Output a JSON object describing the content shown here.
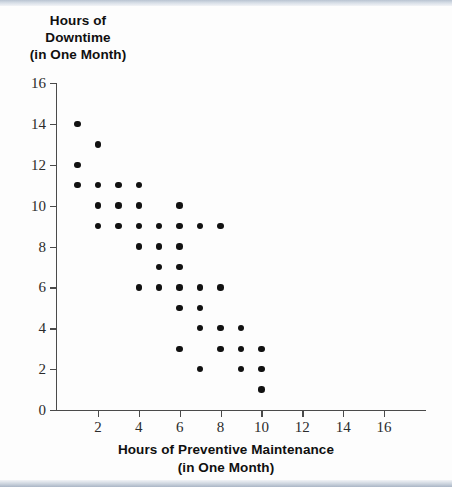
{
  "chart_data": {
    "type": "scatter",
    "title": "",
    "ylabel_lines": [
      "Hours of",
      "Downtime",
      "(in One Month)"
    ],
    "xlabel_lines": [
      "Hours of Preventive Maintenance",
      "(in One Month)"
    ],
    "ylabel": "Hours of Downtime (in One Month)",
    "xlabel": "Hours of Preventive Maintenance (in One Month)",
    "xlim": [
      0,
      16
    ],
    "ylim": [
      0,
      16
    ],
    "xticks": [
      0,
      2,
      4,
      6,
      8,
      10,
      12,
      14,
      16
    ],
    "yticks": [
      0,
      2,
      4,
      6,
      8,
      10,
      12,
      14,
      16
    ],
    "xtick_labels": [
      "0",
      "2",
      "4",
      "6",
      "8",
      "10",
      "12",
      "14",
      "16"
    ],
    "ytick_labels": [
      "0",
      "2",
      "4",
      "6",
      "8",
      "10",
      "12",
      "14",
      "16"
    ],
    "grid": false,
    "legend": false,
    "marker_color": "#111111",
    "axis_color": "#4a4a4a",
    "n_points": 39,
    "x": [
      1,
      1,
      1,
      2,
      2,
      2,
      2,
      3,
      3,
      3,
      4,
      4,
      4,
      4,
      4,
      5,
      5,
      5,
      5,
      6,
      6,
      6,
      6,
      6,
      6,
      6,
      7,
      7,
      7,
      7,
      7,
      8,
      8,
      8,
      8,
      9,
      9,
      9,
      10,
      10,
      10
    ],
    "y": [
      14,
      12,
      11,
      13,
      11,
      10,
      9,
      11,
      10,
      9,
      11,
      10,
      9,
      8,
      6,
      9,
      8,
      7,
      6,
      10,
      9,
      8,
      7,
      6,
      5,
      3,
      9,
      6,
      5,
      4,
      2,
      9,
      6,
      4,
      3,
      4,
      3,
      2,
      3,
      2,
      1
    ],
    "points": [
      {
        "x": 1,
        "y": 14
      },
      {
        "x": 1,
        "y": 12
      },
      {
        "x": 1,
        "y": 11
      },
      {
        "x": 2,
        "y": 13
      },
      {
        "x": 2,
        "y": 11
      },
      {
        "x": 2,
        "y": 10
      },
      {
        "x": 2,
        "y": 9
      },
      {
        "x": 3,
        "y": 11
      },
      {
        "x": 3,
        "y": 10
      },
      {
        "x": 3,
        "y": 9
      },
      {
        "x": 4,
        "y": 11
      },
      {
        "x": 4,
        "y": 10
      },
      {
        "x": 4,
        "y": 9
      },
      {
        "x": 4,
        "y": 8
      },
      {
        "x": 4,
        "y": 6
      },
      {
        "x": 5,
        "y": 9
      },
      {
        "x": 5,
        "y": 8
      },
      {
        "x": 5,
        "y": 7
      },
      {
        "x": 5,
        "y": 6
      },
      {
        "x": 6,
        "y": 10
      },
      {
        "x": 6,
        "y": 9
      },
      {
        "x": 6,
        "y": 8
      },
      {
        "x": 6,
        "y": 7
      },
      {
        "x": 6,
        "y": 6
      },
      {
        "x": 6,
        "y": 5
      },
      {
        "x": 6,
        "y": 3
      },
      {
        "x": 7,
        "y": 9
      },
      {
        "x": 7,
        "y": 6
      },
      {
        "x": 7,
        "y": 5
      },
      {
        "x": 7,
        "y": 4
      },
      {
        "x": 7,
        "y": 2
      },
      {
        "x": 8,
        "y": 9
      },
      {
        "x": 8,
        "y": 6
      },
      {
        "x": 8,
        "y": 4
      },
      {
        "x": 8,
        "y": 3
      },
      {
        "x": 9,
        "y": 4
      },
      {
        "x": 9,
        "y": 3
      },
      {
        "x": 9,
        "y": 2
      },
      {
        "x": 10,
        "y": 3
      },
      {
        "x": 10,
        "y": 2
      },
      {
        "x": 10,
        "y": 1
      }
    ]
  }
}
